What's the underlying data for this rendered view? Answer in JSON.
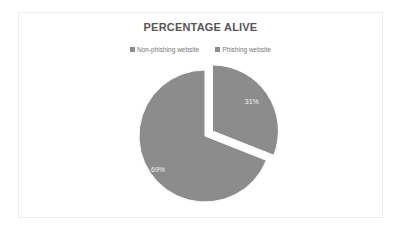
{
  "chart_data": {
    "type": "pie",
    "title": "PERCENTAGE ALIVE",
    "categories": [
      "Non-phishing website",
      "Phishing website"
    ],
    "values": [
      69,
      31
    ],
    "labels": [
      "69%",
      "31%"
    ],
    "exploded": [
      "Phishing website"
    ],
    "legend_position": "top",
    "colors": [
      "#8c8c8c",
      "#8c8c8c"
    ]
  },
  "legend": {
    "items": [
      {
        "label": "Non-phishing website",
        "color": "#8c8c8c"
      },
      {
        "label": "Phishing website",
        "color": "#8c8c8c"
      }
    ]
  }
}
